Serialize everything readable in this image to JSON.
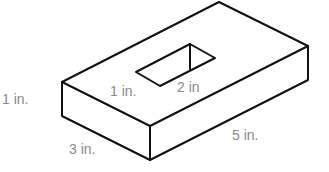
{
  "figure": {
    "type": "isometric rectangular block with rectangular hole",
    "labels": {
      "height": "1 in.",
      "hole_width": "1 in.",
      "hole_length": "2 in",
      "width": "3 in.",
      "length": "5 in."
    },
    "colors": {
      "edge": "#111111",
      "label": "#8a8a8a",
      "background": "#ffffff"
    }
  }
}
